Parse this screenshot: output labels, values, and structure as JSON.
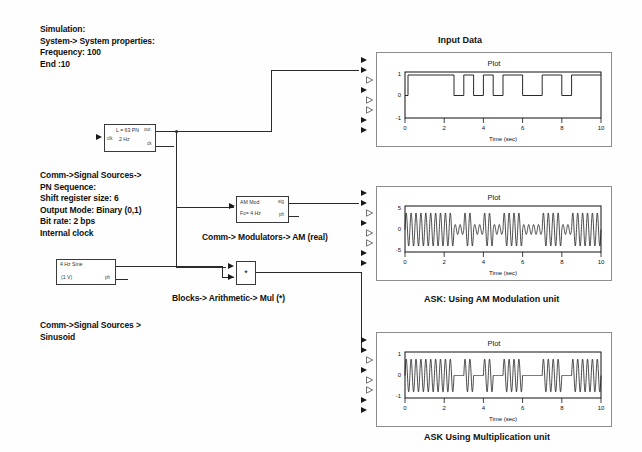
{
  "diagram": {
    "background": "#ffffff",
    "line_color": "#2b2b2b"
  },
  "annotations": {
    "simulation_settings": "Simulation:\nSystem-> System properties:\nFrequency: 100\nEnd :10",
    "pn_sequence_note": "Comm->Signal Sources->\nPN Sequence:\nShift register size: 6\nOutput Mode: Binary (0,1)\nBit rate: 2 bps\nInternal clock",
    "am_note": "Comm-> Modulators-> AM (real)",
    "mul_note": "Blocks-> Arithmetic-> Mul (*)",
    "sine_note": "Comm->Signal Sources >\nSinusoid"
  },
  "blocks": {
    "pn": {
      "title": "L = 63 PN",
      "sub": "2 Hz",
      "in_label": "clk",
      "out_label_1": "out",
      "out_label_2": "ck"
    },
    "am": {
      "title": "AM Mod",
      "sub": "Fc= 4 Hz",
      "out_label_1": "sig",
      "out_label_2": "ph"
    },
    "sine": {
      "title": "4 Hz Sine",
      "sub": "(1 V)",
      "out_label": "ph"
    },
    "mul": {
      "symbol": "*"
    }
  },
  "scopes": [
    {
      "caption": "Input Data",
      "caption_position": "top",
      "plot_title": "Plot",
      "xlabel": "Time (sec)",
      "ylabel": "",
      "yticks": [
        "1",
        "0",
        "-1"
      ],
      "xticks": [
        "0",
        "2",
        "4",
        "6",
        "8",
        "10"
      ],
      "port_count": 8
    },
    {
      "caption": "ASK: Using AM Modulation unit",
      "caption_position": "bottom",
      "plot_title": "Plot",
      "xlabel": "Time (sec)",
      "ylabel": "",
      "yticks": [
        "5",
        "0",
        "-5"
      ],
      "xticks": [
        "0",
        "2",
        "4",
        "6",
        "8",
        "10"
      ],
      "port_count": 8
    },
    {
      "caption": "ASK Using Multiplication unit",
      "caption_position": "bottom",
      "plot_title": "Plot",
      "xlabel": "Time (sec)",
      "ylabel": "",
      "yticks": [
        "1",
        "0",
        "-1"
      ],
      "xticks": [
        "0",
        "2",
        "4",
        "6",
        "8",
        "10"
      ],
      "port_count": 8
    }
  ],
  "chart_data": [
    {
      "type": "line",
      "title": "Plot",
      "name": "Input Data",
      "xlabel": "Time (sec)",
      "ylabel": "",
      "xlim": [
        0,
        10
      ],
      "ylim": [
        -1.4,
        1.4
      ],
      "xticks": [
        0,
        2,
        4,
        6,
        8,
        10
      ],
      "yticks": [
        1,
        0,
        -1
      ],
      "grid": false,
      "description": "PN sequence binary (0,1) square wave at 2 bps, value 1 except low pulses",
      "series": [
        {
          "name": "PN data",
          "step": true,
          "x": [
            0,
            2.5,
            2.5,
            3.0,
            3.0,
            3.5,
            3.5,
            4.0,
            4.0,
            4.5,
            4.5,
            5.0,
            5.0,
            6.0,
            6.0,
            7.0,
            7.0,
            8.0,
            8.0,
            8.5,
            8.5,
            10
          ],
          "y": [
            1,
            1,
            0,
            0,
            1,
            1,
            0,
            0,
            1,
            1,
            0,
            0,
            1,
            1,
            0,
            0,
            1,
            1,
            0,
            0,
            1,
            1
          ]
        }
      ]
    },
    {
      "type": "line",
      "title": "Plot",
      "name": "ASK: Using AM Modulation unit",
      "xlabel": "Time (sec)",
      "ylabel": "",
      "xlim": [
        0,
        10
      ],
      "ylim": [
        -7,
        7
      ],
      "xticks": [
        0,
        2,
        4,
        6,
        8,
        10
      ],
      "yticks": [
        5,
        0,
        -5
      ],
      "grid": false,
      "description": "AM modulated carrier 4 Hz; amplitude 5 when data=1, amplitude ~1.5 when data=0 (carrier never fully off)",
      "series": [
        {
          "name": "AM output",
          "carrier_hz": 4,
          "amp_high": 5,
          "amp_low": 1.5,
          "envelope_x": [
            0,
            2.5,
            2.5,
            3.0,
            3.0,
            3.5,
            3.5,
            4.0,
            4.0,
            4.5,
            4.5,
            5.0,
            5.0,
            6.0,
            6.0,
            7.0,
            7.0,
            8.0,
            8.0,
            8.5,
            8.5,
            10
          ],
          "envelope_y": [
            5,
            5,
            1.5,
            1.5,
            5,
            5,
            1.5,
            1.5,
            5,
            5,
            1.5,
            1.5,
            5,
            5,
            1.5,
            1.5,
            5,
            5,
            1.5,
            1.5,
            5,
            5
          ]
        }
      ]
    },
    {
      "type": "line",
      "title": "Plot",
      "name": "ASK Using Multiplication unit",
      "xlabel": "Time (sec)",
      "ylabel": "",
      "xlim": [
        0,
        10
      ],
      "ylim": [
        -1.4,
        1.4
      ],
      "xticks": [
        0,
        2,
        4,
        6,
        8,
        10
      ],
      "yticks": [
        1,
        0,
        -1
      ],
      "grid": false,
      "description": "True ASK: 4 Hz sine multiplied by binary data; amplitude 1 when data=1, zero when data=0",
      "series": [
        {
          "name": "Multiplier output",
          "carrier_hz": 4,
          "amp_high": 1,
          "amp_low": 0,
          "envelope_x": [
            0,
            2.5,
            2.5,
            3.0,
            3.0,
            3.5,
            3.5,
            4.0,
            4.0,
            4.5,
            4.5,
            5.0,
            5.0,
            6.0,
            6.0,
            7.0,
            7.0,
            8.0,
            8.0,
            8.5,
            8.5,
            10
          ],
          "envelope_y": [
            1,
            1,
            0,
            0,
            1,
            1,
            0,
            0,
            1,
            1,
            0,
            0,
            1,
            1,
            0,
            0,
            1,
            1,
            0,
            0,
            1,
            1
          ]
        }
      ]
    }
  ]
}
